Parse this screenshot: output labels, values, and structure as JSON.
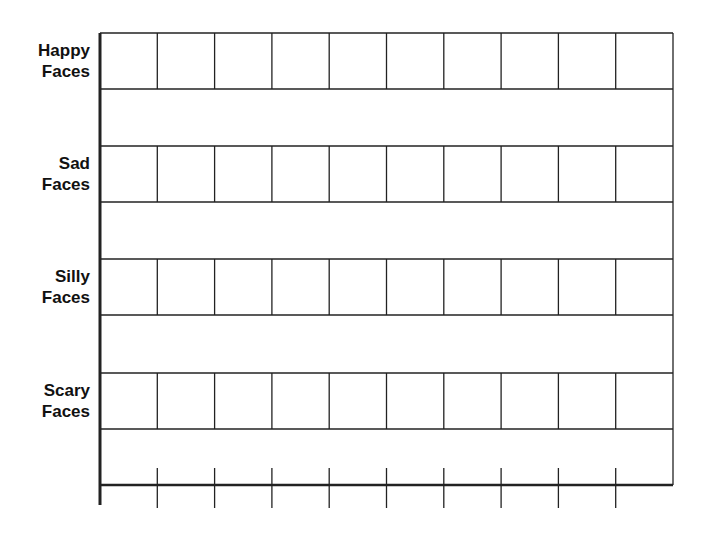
{
  "chart_data": {
    "type": "table",
    "title": "",
    "xlabel": "",
    "ylabel": "",
    "categories": [
      "Happy Faces",
      "Sad Faces",
      "Silly Faces",
      "Scary Faces"
    ],
    "columns_per_row": 10,
    "values": [
      null,
      null,
      null,
      null
    ],
    "x_ticks": 10,
    "x_tick_labels": [],
    "grid": true,
    "legend": null
  },
  "labels": [
    {
      "line1": "Happy",
      "line2": "Faces"
    },
    {
      "line1": "Sad",
      "line2": "Faces"
    },
    {
      "line1": "Silly",
      "line2": "Faces"
    },
    {
      "line1": "Scary",
      "line2": "Faces"
    }
  ],
  "colors": {
    "line": "#222222",
    "background": "#ffffff",
    "text": "#111111"
  }
}
